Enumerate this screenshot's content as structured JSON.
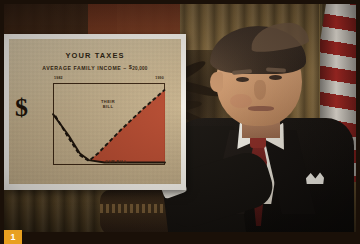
{
  "photo": {
    "scene": "presidential-address-tax-chart",
    "backdrop": {
      "curtain_color": "#7b6136",
      "wall_color": "#7b3a20",
      "flag_red": "#b02a25",
      "flag_white": "#f2ece2"
    },
    "subject": {
      "suit_color": "#14110e",
      "shirt_color": "#f4f1ea",
      "tie_color": "#5d1a18",
      "pocket_square_color": "#f2efe7",
      "skin_color": "#d9a377",
      "hair_color": "#5b4634"
    },
    "props": {
      "urn_label": "decorative-urn",
      "plant_label": "potted-plant"
    }
  },
  "board": {
    "frame_color": "#f3f0ea",
    "surface_color": "#cdb893",
    "dollar_symbol": "$"
  },
  "chart_data": {
    "type": "line",
    "title": "YOUR TAXES",
    "subtitle_prefix": "AVERAGE FAMILY INCOME – ",
    "subtitle_currency": "$",
    "subtitle_amount": "20,000",
    "xlabel": "",
    "ylabel": "",
    "x_tick_start": "1982",
    "x_tick_end": "1990",
    "x": [
      1982,
      1990
    ],
    "xlim": [
      1982,
      1990
    ],
    "ylim": [
      0,
      100
    ],
    "grid": false,
    "legend_position": "inline-annotations",
    "fill_color": "#b5432a",
    "line_color": "#1d1208",
    "annotations": [
      {
        "name": "their-bill",
        "text_line1": "THEIR",
        "text_line2": "BILL"
      },
      {
        "name": "our-bill",
        "text": "OUR BILL"
      }
    ],
    "series": [
      {
        "name": "OUR BILL",
        "style": "solid",
        "points": [
          [
            0,
            62
          ],
          [
            14,
            36
          ],
          [
            24,
            14
          ],
          [
            32,
            6
          ],
          [
            46,
            3
          ],
          [
            100,
            3
          ]
        ]
      },
      {
        "name": "THEIR BILL",
        "style": "dashed",
        "points": [
          [
            2,
            60
          ],
          [
            14,
            33
          ],
          [
            24,
            12
          ],
          [
            32,
            5
          ],
          [
            40,
            14
          ],
          [
            60,
            42
          ],
          [
            80,
            68
          ],
          [
            100,
            92
          ]
        ]
      }
    ]
  },
  "badge": {
    "number": "1",
    "color": "#e8a020"
  }
}
